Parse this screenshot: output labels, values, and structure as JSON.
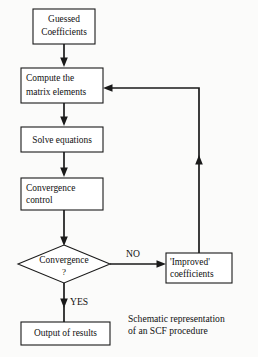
{
  "diagram": {
    "title": "Schematic representation of an SCF procedure",
    "type": "flowchart",
    "orientation": "top-to-bottom with feedback loop",
    "colors": {
      "background": "#fbfbfa",
      "node_fill": "#ffffff",
      "stroke": "#1a1a1a",
      "text": "#111111"
    },
    "nodes": {
      "guessed": {
        "shape": "rectangle",
        "line1": "Guessed",
        "line2": "Coefficients"
      },
      "compute": {
        "shape": "rectangle",
        "line1": "Compute the",
        "line2": "matrix elements"
      },
      "solve": {
        "shape": "rectangle",
        "line1": "Solve equations"
      },
      "convergence_control": {
        "shape": "rectangle",
        "line1": "Convergence",
        "line2": "control"
      },
      "decision": {
        "shape": "diamond",
        "line1": "Convergence",
        "line2": "?"
      },
      "improved": {
        "shape": "rectangle",
        "line1": "'Improved'",
        "line2": "coefficients"
      },
      "output": {
        "shape": "rectangle",
        "line1": "Output of results"
      }
    },
    "edge_labels": {
      "no": "NO",
      "yes": "YES"
    },
    "caption": {
      "line1": "Schematic representation",
      "line2": "of an SCF procedure"
    }
  }
}
